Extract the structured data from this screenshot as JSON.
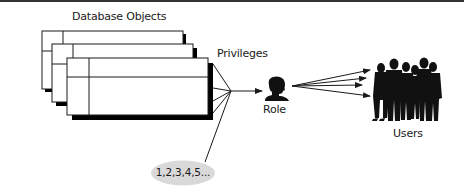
{
  "diagram": {
    "type": "flow",
    "colors": {
      "line": "#1a1a1a",
      "shadow": "#000000",
      "frame_fill": "#ffffff",
      "ellipse_fill": "#d9d9d9",
      "top_bar": "#333333"
    },
    "nodes": {
      "database_objects": {
        "label": "Database Objects",
        "icon": "stacked-tables-icon",
        "count": 3
      },
      "privileges": {
        "label": "Privileges"
      },
      "role": {
        "label": "Role",
        "icon": "person-silhouette-icon"
      },
      "users": {
        "label": "Users",
        "icon": "group-silhouette-icon"
      },
      "sequence": {
        "label": "1,2,3,4,5...",
        "shape": "ellipse"
      }
    },
    "edges": [
      {
        "from": "database_objects",
        "to": "privileges",
        "label": ""
      },
      {
        "from": "sequence",
        "to": "privileges",
        "label": ""
      },
      {
        "from": "privileges",
        "to": "role",
        "label": "",
        "arrow": true
      },
      {
        "from": "role",
        "to": "users",
        "label": "",
        "arrow": true,
        "count": 4
      }
    ]
  }
}
